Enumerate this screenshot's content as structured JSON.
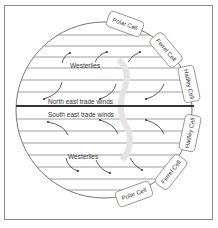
{
  "diagram": {
    "winds": {
      "north_westerlies": "Westerlies",
      "north_trades": "North east trade winds",
      "south_trades": "South east trade winds",
      "south_westerlies": "Westerlies"
    },
    "cells": {
      "north_polar": "Polar Cell",
      "north_ferrel": "Ferrel Cell",
      "north_hadley": "Hadley Cell",
      "south_hadley": "Hadley Cell",
      "south_ferrel": "Ferrel Cell",
      "south_polar": "Polar Cell"
    },
    "colors": {
      "line": "#555555",
      "equator": "#333333",
      "border": "#8a8a8a",
      "text": "#333333"
    }
  }
}
